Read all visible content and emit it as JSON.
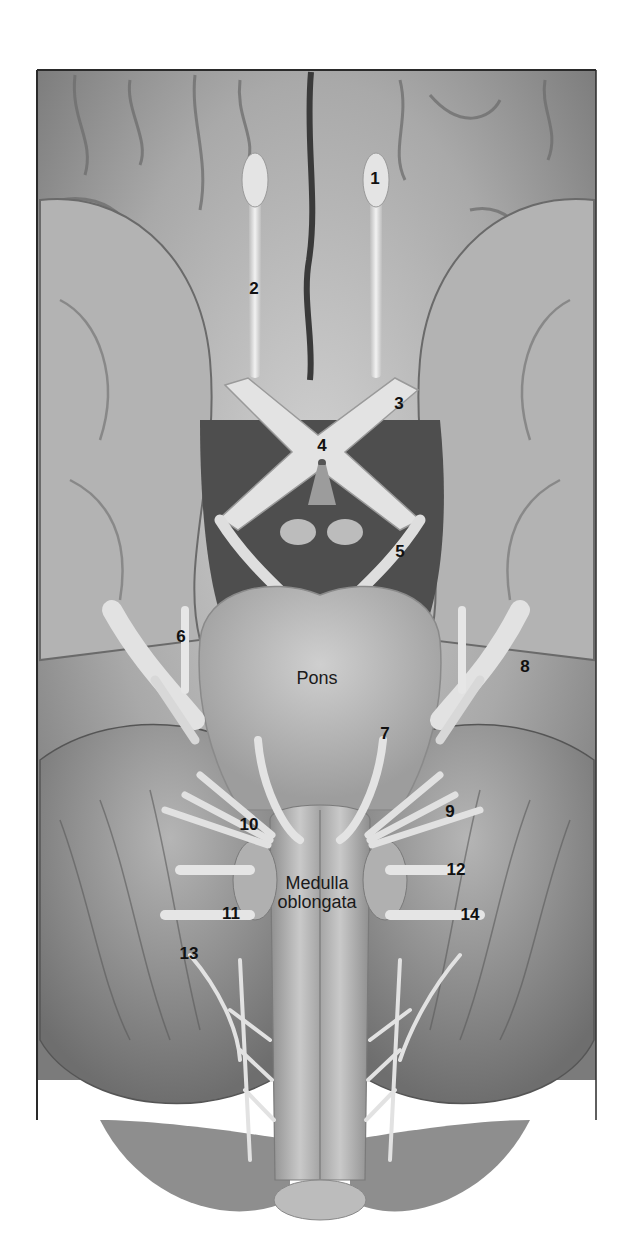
{
  "figure": {
    "regions": [
      {
        "id": "pons",
        "text": "Pons",
        "x": 317,
        "y": 678
      },
      {
        "id": "medulla",
        "text": "Medulla\noblongata",
        "x": 317,
        "y": 893
      }
    ],
    "labels": [
      {
        "n": "1",
        "x": 375,
        "y": 178
      },
      {
        "n": "2",
        "x": 254,
        "y": 288
      },
      {
        "n": "3",
        "x": 399,
        "y": 403
      },
      {
        "n": "4",
        "x": 322,
        "y": 445
      },
      {
        "n": "5",
        "x": 400,
        "y": 551
      },
      {
        "n": "6",
        "x": 181,
        "y": 636
      },
      {
        "n": "7",
        "x": 385,
        "y": 733
      },
      {
        "n": "8",
        "x": 525,
        "y": 666
      },
      {
        "n": "9",
        "x": 450,
        "y": 811
      },
      {
        "n": "10",
        "x": 249,
        "y": 824
      },
      {
        "n": "11",
        "x": 231,
        "y": 913
      },
      {
        "n": "12",
        "x": 456,
        "y": 869
      },
      {
        "n": "13",
        "x": 189,
        "y": 953
      },
      {
        "n": "14",
        "x": 470,
        "y": 914
      }
    ],
    "colors": {
      "background": "#ffffff",
      "frame": "#2a2a2a",
      "tissue_light": "#e6e6e6",
      "tissue_mid": "#a8a8a8",
      "tissue_dark": "#5a5a5a",
      "nerve": "#ececec",
      "label": "#111111"
    }
  }
}
